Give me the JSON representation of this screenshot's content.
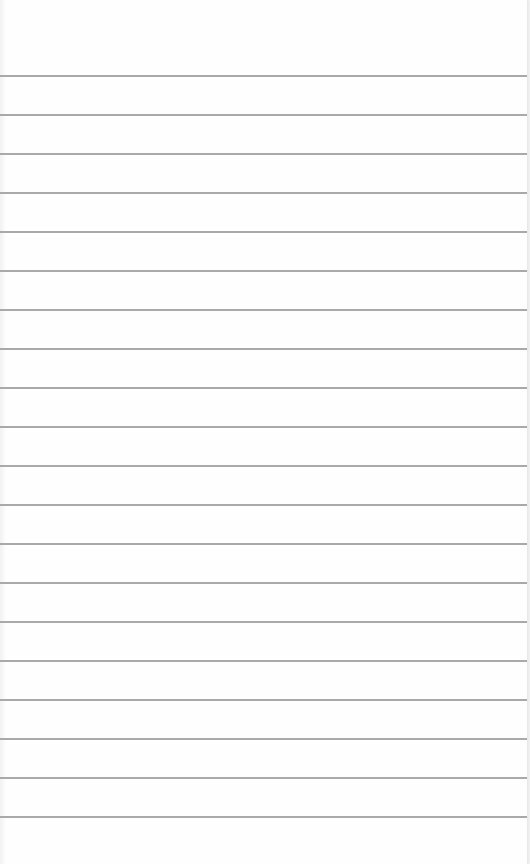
{
  "page": {
    "type": "ruled notebook paper",
    "ruled_line_count": 20,
    "line_color": "#a9a9a9",
    "paper_color": "#fefefe"
  }
}
